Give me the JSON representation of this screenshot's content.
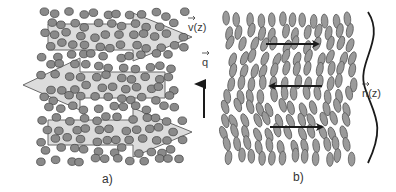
{
  "figure": {
    "panels": [
      {
        "id": "a",
        "label": "a)",
        "description": "flow velocity field with particles"
      },
      {
        "id": "b",
        "label": "b)",
        "description": "ellipsoidal molecules with director field"
      }
    ],
    "labels": {
      "velocity": {
        "symbol": "v",
        "arg": "(z)"
      },
      "wavevector": {
        "symbol": "q",
        "arg": ""
      },
      "director": {
        "symbol": "n",
        "arg": "(z)"
      }
    },
    "colors": {
      "arrow_fill": "#dcdcdc",
      "arrow_stroke": "#6a6a6a",
      "particle_fill": "#8a8a8a",
      "particle_stroke": "#4a4a4a",
      "ellipse_fill": "#9a9a9a",
      "ellipse_stroke": "#5a5a5a",
      "black_arrow": "#1a1a1a"
    },
    "panel_a": {
      "flow_arrows": [
        {
          "direction": "right",
          "y": 37
        },
        {
          "direction": "left",
          "y": 85
        },
        {
          "direction": "right",
          "y": 132
        }
      ]
    },
    "panel_b": {
      "flow_arrows": [
        {
          "direction": "right",
          "y": 44
        },
        {
          "direction": "left",
          "y": 86
        },
        {
          "direction": "right",
          "y": 127
        }
      ]
    }
  }
}
